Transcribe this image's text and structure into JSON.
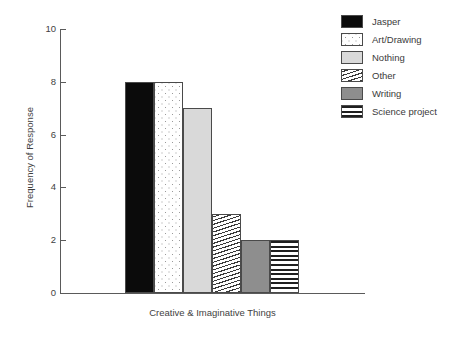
{
  "chart_data": {
    "type": "bar",
    "title": "",
    "subtitle": "",
    "xlabel": "Creative & Imaginative Things",
    "ylabel": "Frequency of Response",
    "categories": [
      "Jasper",
      "Art/Drawing",
      "Nothing",
      "Other",
      "Writing",
      "Science project"
    ],
    "values": [
      8,
      8,
      7,
      3,
      2,
      2
    ],
    "ylim": [
      0,
      10
    ],
    "yticks": [
      0,
      2,
      4,
      6,
      8,
      10
    ],
    "xticks": [],
    "grid": false,
    "legend_position": "right",
    "series": [
      {
        "name": "Frequency of Response",
        "values": [
          8,
          8,
          7,
          3,
          2,
          2
        ]
      }
    ],
    "bars": [
      {
        "label": "Jasper",
        "value": 8,
        "pattern": "solid-black",
        "color": "#0b0b0b"
      },
      {
        "label": "Art/Drawing",
        "value": 8,
        "pattern": "dots",
        "color": "#ffffff"
      },
      {
        "label": "Nothing",
        "value": 7,
        "pattern": "solid-light",
        "color": "#d9d9d9"
      },
      {
        "label": "Other",
        "value": 3,
        "pattern": "diagonal",
        "color": "#ffffff"
      },
      {
        "label": "Writing",
        "value": 2,
        "pattern": "solid-mid",
        "color": "#8e8e8e"
      },
      {
        "label": "Science project",
        "value": 2,
        "pattern": "horizontal",
        "color": "#ffffff"
      }
    ]
  },
  "axis": {
    "y_title": "Frequency of Response",
    "x_title": "Creative & Imaginative Things",
    "y_labels": [
      "10",
      "8",
      "6",
      "4",
      "2",
      "0"
    ]
  },
  "legend": {
    "items": [
      {
        "label": "Jasper"
      },
      {
        "label": "Art/Drawing"
      },
      {
        "label": "Nothing"
      },
      {
        "label": "Other"
      },
      {
        "label": "Writing"
      },
      {
        "label": "Science project"
      }
    ]
  }
}
